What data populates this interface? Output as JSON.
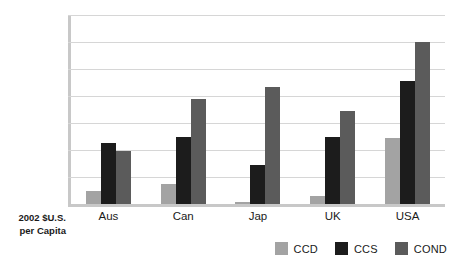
{
  "chart_data": {
    "type": "bar",
    "title": "",
    "xlabel": "",
    "ylabel": "2002 $U.S. per Capita",
    "ylabel_lines": [
      "2002 $U.S.",
      "per Capita"
    ],
    "categories": [
      "Aus",
      "Can",
      "Jap",
      "UK",
      "USA"
    ],
    "series": [
      {
        "name": "CCD",
        "color": "#a3a3a3",
        "values": [
          500,
          750,
          60,
          300,
          2450
        ]
      },
      {
        "name": "CCS",
        "color": "#1c1c1c",
        "values": [
          2250,
          2480,
          1450,
          2500,
          4550
        ]
      },
      {
        "name": "COND",
        "color": "#5b5b5b",
        "values": [
          1980,
          3900,
          4350,
          3450,
          6000
        ]
      }
    ],
    "ylim": [
      0,
      7000
    ],
    "yticks": [
      0,
      1000,
      2000,
      3000,
      4000,
      5000,
      6000,
      7000
    ],
    "ytick_labels": [
      "0",
      "1000",
      "2000",
      "3000",
      "4000",
      "5000",
      "6000",
      "7000"
    ],
    "grid": true,
    "legend_position": "bottom-right"
  },
  "legend": {
    "items": [
      {
        "label": "CCD",
        "color": "#a3a3a3"
      },
      {
        "label": "CCS",
        "color": "#1c1c1c"
      },
      {
        "label": "COND",
        "color": "#5b5b5b"
      }
    ]
  },
  "colors": {
    "background": "#ffffff",
    "axis": "#c8c8c8",
    "gridline": "#d6d6d6",
    "text": "#1a1a1a"
  }
}
